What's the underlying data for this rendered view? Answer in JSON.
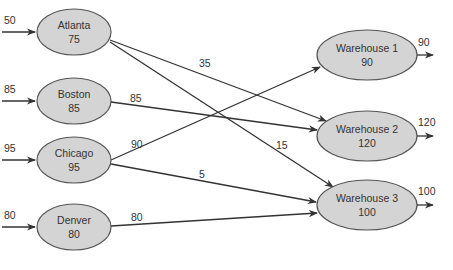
{
  "diagram": {
    "type": "network-flow",
    "sources": [
      {
        "id": "atlanta",
        "name": "Atlanta",
        "value": "75",
        "inflow": "50",
        "cx": 74,
        "cy": 32,
        "rx": 37,
        "ry": 23
      },
      {
        "id": "boston",
        "name": "Boston",
        "value": "85",
        "inflow": "85",
        "cx": 74,
        "cy": 101,
        "rx": 37,
        "ry": 23
      },
      {
        "id": "chicago",
        "name": "Chicago",
        "value": "95",
        "inflow": "95",
        "cx": 74,
        "cy": 160,
        "rx": 37,
        "ry": 23
      },
      {
        "id": "denver",
        "name": "Denver",
        "value": "80",
        "inflow": "80",
        "cx": 74,
        "cy": 227,
        "rx": 37,
        "ry": 23
      }
    ],
    "sinks": [
      {
        "id": "warehouse1",
        "name": "Warehouse 1",
        "value": "90",
        "outflow": "90",
        "cx": 367,
        "cy": 55,
        "rx": 50,
        "ry": 25
      },
      {
        "id": "warehouse2",
        "name": "Warehouse 2",
        "value": "120",
        "outflow": "120",
        "cx": 367,
        "cy": 136,
        "rx": 50,
        "ry": 25
      },
      {
        "id": "warehouse3",
        "name": "Warehouse 3",
        "value": "100",
        "outflow": "100",
        "cx": 367,
        "cy": 205,
        "rx": 50,
        "ry": 25
      }
    ],
    "edges": [
      {
        "from": "atlanta",
        "to": "warehouse2",
        "label": "35"
      },
      {
        "from": "atlanta",
        "to": "warehouse3",
        "label": "15"
      },
      {
        "from": "boston",
        "to": "warehouse2",
        "label": "85"
      },
      {
        "from": "chicago",
        "to": "warehouse1",
        "label": "90"
      },
      {
        "from": "chicago",
        "to": "warehouse3",
        "label": "5"
      },
      {
        "from": "denver",
        "to": "warehouse3",
        "label": "80"
      }
    ]
  }
}
